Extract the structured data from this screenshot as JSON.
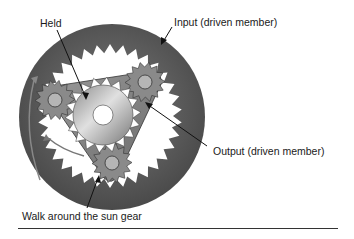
{
  "diagram": {
    "type": "planetary-gear-set",
    "labels": {
      "held": "Held",
      "input": "Input (driven member)",
      "output": "Output (driven member)",
      "walk": "Walk around the sun gear"
    },
    "colors": {
      "ring": "#5a5a5a",
      "carrier": "#8a8a8a",
      "sun": "#a8a8a8",
      "arrow": "#222222"
    }
  }
}
